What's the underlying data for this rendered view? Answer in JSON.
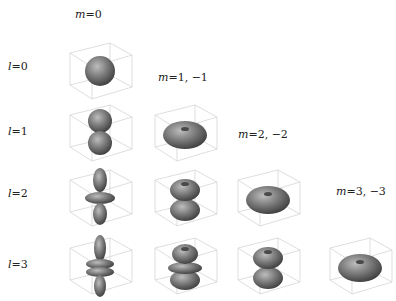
{
  "column_headers": [
    {
      "m": "m",
      "eq": "=0",
      "x": 75,
      "y": 8
    },
    {
      "m": "m",
      "eq": "=1, −1",
      "x": 158,
      "y": 71
    },
    {
      "m": "m",
      "eq": "=2, −2",
      "x": 238,
      "y": 128
    },
    {
      "m": "m",
      "eq": "=3, −3",
      "x": 336,
      "y": 185
    }
  ],
  "row_labels": [
    {
      "l": "l",
      "eq": "=0",
      "x": 8,
      "y": 60
    },
    {
      "l": "l",
      "eq": "=1",
      "x": 8,
      "y": 125
    },
    {
      "l": "l",
      "eq": "=2",
      "x": 8,
      "y": 187
    },
    {
      "l": "l",
      "eq": "=3",
      "x": 8,
      "y": 258
    }
  ],
  "plots": [
    {
      "l": 0,
      "m": "0",
      "shape": "sphere",
      "x": 60,
      "y": 33
    },
    {
      "l": 1,
      "m": "0",
      "shape": "dumbbell",
      "x": 60,
      "y": 95
    },
    {
      "l": 1,
      "m": "1,-1",
      "shape": "torus",
      "x": 145,
      "y": 95
    },
    {
      "l": 2,
      "m": "0",
      "shape": "d2",
      "x": 60,
      "y": 160
    },
    {
      "l": 2,
      "m": "1,-1",
      "shape": "d21",
      "x": 145,
      "y": 160
    },
    {
      "l": 2,
      "m": "2,-2",
      "shape": "torus",
      "x": 228,
      "y": 160
    },
    {
      "l": 3,
      "m": "0",
      "shape": "f30",
      "x": 60,
      "y": 228
    },
    {
      "l": 3,
      "m": "1,-1",
      "shape": "f31",
      "x": 145,
      "y": 228
    },
    {
      "l": 3,
      "m": "2,-2",
      "shape": "d21",
      "x": 228,
      "y": 228
    },
    {
      "l": 3,
      "m": "3,-3",
      "shape": "torus",
      "x": 320,
      "y": 228
    }
  ]
}
